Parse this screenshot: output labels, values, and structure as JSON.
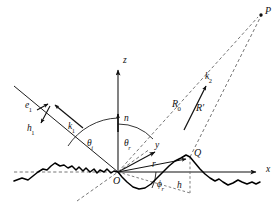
{
  "figure": {
    "background_color": "#ffffff",
    "line_color": "#1a1a1a",
    "dashed_color": "#555555",
    "surface_color": "#000000",
    "width": 279,
    "height": 219
  },
  "axes": {
    "x_label": "x",
    "y_label": "y",
    "z_label": "z",
    "origin_label": "O",
    "normal_label": "n"
  },
  "points": {
    "observation_point": "P",
    "surface_point": "Q",
    "origin": "O"
  },
  "vectors": {
    "incident_wavevector": "k",
    "incident_wavevector_sub": "1",
    "incident_efield": "e",
    "incident_efield_sub": "1",
    "incident_hfield": "h",
    "incident_hfield_sub": "1",
    "scattered_wavevector": "k",
    "scattered_wavevector_sub": "2",
    "position_vector": "r"
  },
  "angles": {
    "incidence": "θ",
    "incidence_sub": "i",
    "reflection": "θ",
    "reflection_sub": "r",
    "azimuth": "ϕ",
    "azimuth_sub": "r"
  },
  "distances": {
    "reference_distance": "R",
    "reference_distance_sub": "0",
    "point_distance": "R′",
    "height_label": "h"
  },
  "geometry": {
    "origin_px": [
      118,
      172
    ],
    "z_axis_top_px": [
      118,
      62
    ],
    "x_axis_end_px": [
      263,
      172
    ],
    "y_axis_end_px": [
      160,
      150
    ],
    "point_P_px": [
      262,
      13
    ],
    "point_Q_px": [
      190,
      157
    ],
    "incident_start_px": [
      16,
      88
    ]
  }
}
